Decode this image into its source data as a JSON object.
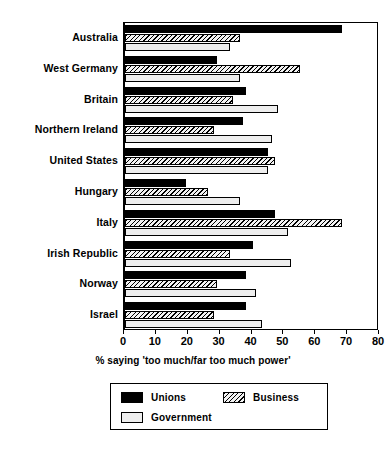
{
  "chart_data": {
    "type": "bar",
    "orientation": "horizontal",
    "title": "",
    "xlabel": "% saying 'too much/far too much power'",
    "ylabel": "",
    "xlim": [
      0,
      80
    ],
    "xticks": [
      0,
      10,
      20,
      30,
      40,
      50,
      60,
      70,
      80
    ],
    "grid": false,
    "legend_position": "bottom",
    "categories": [
      "Australia",
      "West Germany",
      "Britain",
      "Northern Ireland",
      "United States",
      "Hungary",
      "Italy",
      "Irish Republic",
      "Norway",
      "Israel"
    ],
    "series": [
      {
        "name": "Unions",
        "fill": "solid-black",
        "color": "#000000",
        "values": [
          68,
          29,
          38,
          37,
          45,
          19,
          47,
          40,
          38,
          38
        ]
      },
      {
        "name": "Business",
        "fill": "diagonal-hatch",
        "color": "#f2f2f2",
        "values": [
          36,
          55,
          34,
          28,
          47,
          26,
          68,
          33,
          29,
          28
        ]
      },
      {
        "name": "Government",
        "fill": "light-gray",
        "color": "#eeeeee",
        "values": [
          33,
          36,
          48,
          46,
          45,
          36,
          51,
          52,
          41,
          43
        ]
      }
    ]
  },
  "legend": {
    "entries": [
      {
        "label": "Unions"
      },
      {
        "label": "Business"
      },
      {
        "label": "Government"
      }
    ]
  }
}
